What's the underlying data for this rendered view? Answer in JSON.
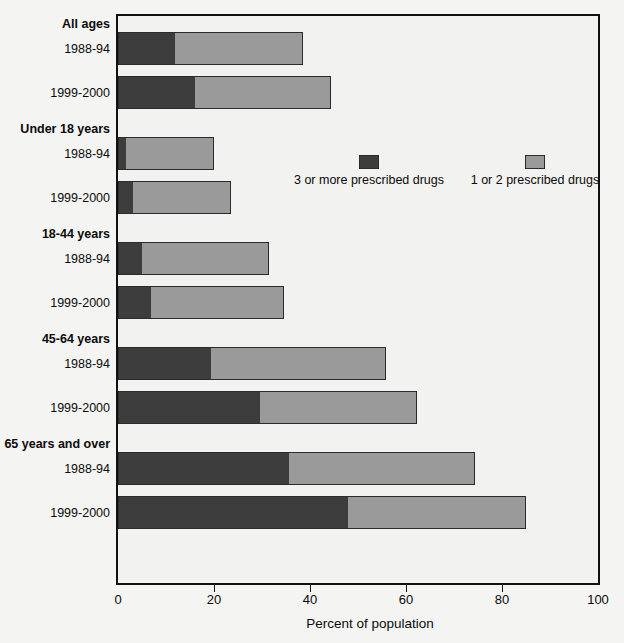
{
  "chart_data": {
    "type": "bar",
    "orientation": "horizontal",
    "stacked": true,
    "title": "",
    "xlabel": "Percent of population",
    "ylabel": "",
    "xlim": [
      0,
      100
    ],
    "xticks": [
      0,
      20,
      40,
      60,
      80,
      100
    ],
    "xtick_labels": [
      "0",
      "20",
      "40",
      "60",
      "80",
      "100"
    ],
    "grid": false,
    "legend_position": "upper-center-right",
    "series": [
      {
        "name": "3 or more prescribed drugs",
        "color": "#3d3d3d",
        "values": [
          11.8,
          16.1,
          1.7,
          3.1,
          5.0,
          6.8,
          19.4,
          29.5,
          35.7,
          47.9
        ]
      },
      {
        "name": "1 or 2 prescribed drugs",
        "color": "#9a9a9a",
        "values": [
          26.8,
          28.3,
          18.3,
          20.4,
          26.4,
          27.7,
          36.4,
          32.7,
          38.7,
          37.0
        ]
      }
    ],
    "totals": [
      38.6,
      44.4,
      20.0,
      23.5,
      31.4,
      34.5,
      55.8,
      62.2,
      74.4,
      84.9
    ],
    "groups": [
      {
        "label": "All ages",
        "rows": [
          {
            "label": "1988-94",
            "dark": 11.8,
            "light": 26.8,
            "total": 38.6
          },
          {
            "label": "1999-2000",
            "dark": 16.1,
            "light": 28.3,
            "total": 44.4
          }
        ]
      },
      {
        "label": "Under 18 years",
        "rows": [
          {
            "label": "1988-94",
            "dark": 1.7,
            "light": 18.3,
            "total": 20.0
          },
          {
            "label": "1999-2000",
            "dark": 3.1,
            "light": 20.4,
            "total": 23.5
          }
        ]
      },
      {
        "label": "18-44 years",
        "rows": [
          {
            "label": "1988-94",
            "dark": 5.0,
            "light": 26.4,
            "total": 31.4
          },
          {
            "label": "1999-2000",
            "dark": 6.8,
            "light": 27.7,
            "total": 34.5
          }
        ]
      },
      {
        "label": "45-64 years",
        "rows": [
          {
            "label": "1988-94",
            "dark": 19.4,
            "light": 36.4,
            "total": 55.8
          },
          {
            "label": "1999-2000",
            "dark": 29.5,
            "light": 32.7,
            "total": 62.2
          }
        ]
      },
      {
        "label": "65 years and over",
        "rows": [
          {
            "label": "1988-94",
            "dark": 35.7,
            "light": 38.7,
            "total": 74.4
          },
          {
            "label": "1999-2000",
            "dark": 47.9,
            "light": 37.0,
            "total": 84.9
          }
        ]
      }
    ]
  },
  "axis": {
    "x_title": "Percent of population",
    "tick_labels": [
      "0",
      "20",
      "40",
      "60",
      "80",
      "100"
    ]
  },
  "legend": {
    "items": [
      {
        "label": "3 or more prescribed drugs",
        "color": "#3d3d3d"
      },
      {
        "label": "1 or 2 prescribed drugs",
        "color": "#9a9a9a"
      }
    ]
  }
}
